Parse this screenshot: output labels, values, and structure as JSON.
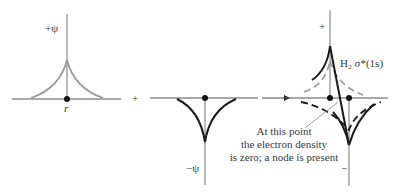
{
  "diagram": {
    "panels": [
      {
        "id": "atom-a",
        "axis_label": "+ψ",
        "point_label": "r",
        "curve": "positive cusp (grey)"
      },
      {
        "id": "atom-b",
        "axis_label": "−ψ",
        "curve": "negative cusp (black)"
      },
      {
        "id": "result",
        "axis_label_top": "+",
        "axis_label_bottom": "−",
        "orbital_label": "H₂ σ*(1s)"
      }
    ],
    "operators": {
      "plus": "+",
      "arrow": "→"
    },
    "annotation": {
      "line1": "At this point",
      "line2": "the electron density",
      "line3": "is zero; a node is present"
    },
    "colors": {
      "grey_curve": "#9a9a9a",
      "black_curve": "#1a1a1a",
      "axis": "#555555"
    }
  }
}
